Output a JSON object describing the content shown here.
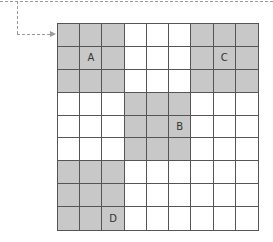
{
  "diagram": {
    "rows": 9,
    "cols": 9,
    "colors": {
      "shaded": "#c8c8c8",
      "empty": "#ffffff",
      "grid_line": "#555555",
      "connector": "#9a9a9a"
    },
    "regions": [
      {
        "label": "A",
        "rows": [
          0,
          2
        ],
        "cols": [
          0,
          2
        ],
        "label_cell": [
          1,
          1
        ]
      },
      {
        "label": "C",
        "rows": [
          0,
          2
        ],
        "cols": [
          6,
          8
        ],
        "label_cell": [
          1,
          7
        ]
      },
      {
        "label": "B",
        "rows": [
          3,
          5
        ],
        "cols": [
          3,
          5
        ],
        "label_cell": [
          4,
          5
        ]
      },
      {
        "label": "D",
        "rows": [
          6,
          8
        ],
        "cols": [
          0,
          2
        ],
        "label_cell": [
          8,
          2
        ]
      }
    ],
    "connector": {
      "style": "dashed",
      "target_cell": [
        0,
        0
      ],
      "arrow": true
    }
  }
}
